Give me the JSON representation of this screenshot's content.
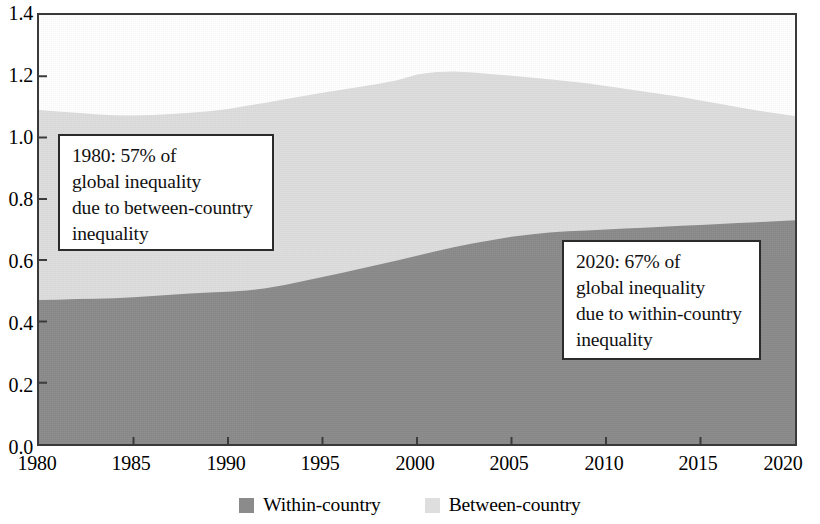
{
  "chart_data": {
    "type": "area",
    "stacked": true,
    "title": "",
    "xlabel": "",
    "ylabel": "",
    "xlim": [
      1980,
      2020
    ],
    "ylim": [
      0.0,
      1.4
    ],
    "grid": false,
    "legend_position": "bottom-center",
    "x_ticks": [
      "1980",
      "1985",
      "1990",
      "1995",
      "2000",
      "2005",
      "2010",
      "2015",
      "2020"
    ],
    "y_ticks": [
      "0.0",
      "0.2",
      "0.4",
      "0.6",
      "0.8",
      "1.0",
      "1.2",
      "1.4"
    ],
    "x": [
      1980,
      1981,
      1982,
      1983,
      1984,
      1985,
      1986,
      1987,
      1988,
      1989,
      1990,
      1991,
      1992,
      1993,
      1994,
      1995,
      1996,
      1997,
      1998,
      1999,
      2000,
      2001,
      2002,
      2003,
      2004,
      2005,
      2006,
      2007,
      2008,
      2009,
      2010,
      2011,
      2012,
      2013,
      2014,
      2015,
      2016,
      2017,
      2018,
      2019,
      2020
    ],
    "series": [
      {
        "name": "Within-country",
        "color": "#8b8b8b",
        "values": [
          0.47,
          0.471,
          0.473,
          0.474,
          0.476,
          0.479,
          0.483,
          0.487,
          0.491,
          0.494,
          0.497,
          0.501,
          0.508,
          0.519,
          0.532,
          0.545,
          0.558,
          0.572,
          0.586,
          0.6,
          0.614,
          0.629,
          0.643,
          0.655,
          0.666,
          0.676,
          0.684,
          0.69,
          0.694,
          0.697,
          0.7,
          0.703,
          0.706,
          0.709,
          0.712,
          0.715,
          0.718,
          0.721,
          0.724,
          0.727,
          0.73
        ]
      },
      {
        "name": "Between-country",
        "color": "#dedede",
        "values": [
          0.62,
          0.614,
          0.608,
          0.602,
          0.597,
          0.593,
          0.591,
          0.59,
          0.59,
          0.592,
          0.596,
          0.603,
          0.606,
          0.606,
          0.604,
          0.601,
          0.598,
          0.594,
          0.59,
          0.588,
          0.592,
          0.585,
          0.573,
          0.557,
          0.541,
          0.526,
          0.512,
          0.5,
          0.49,
          0.48,
          0.468,
          0.456,
          0.444,
          0.432,
          0.42,
          0.406,
          0.392,
          0.378,
          0.364,
          0.352,
          0.34
        ]
      }
    ],
    "totals": [
      1.09,
      1.085,
      1.081,
      1.076,
      1.073,
      1.072,
      1.074,
      1.077,
      1.081,
      1.086,
      1.093,
      1.104,
      1.114,
      1.125,
      1.136,
      1.146,
      1.156,
      1.166,
      1.176,
      1.188,
      1.206,
      1.214,
      1.216,
      1.212,
      1.207,
      1.202,
      1.196,
      1.19,
      1.184,
      1.177,
      1.168,
      1.159,
      1.15,
      1.141,
      1.132,
      1.121,
      1.11,
      1.099,
      1.088,
      1.079,
      1.07
    ],
    "annotations": [
      {
        "id": "note-1980",
        "text": "1980: 57% of\nglobal inequality\ndue to between-country\ninequality"
      },
      {
        "id": "note-2020",
        "text": "2020: 67% of\nglobal inequality\ndue to within-country\ninequality"
      }
    ]
  },
  "legend": {
    "items": [
      {
        "label": "Within-country",
        "color": "#8b8b8b"
      },
      {
        "label": "Between-country",
        "color": "#dedede"
      }
    ]
  },
  "axis": {
    "y_labels": [
      "1.4",
      "1.2",
      "1.0",
      "0.8",
      "0.6",
      "0.4",
      "0.2",
      "0.0"
    ],
    "x_labels": [
      "1980",
      "1985",
      "1990",
      "1995",
      "2000",
      "2005",
      "2010",
      "2015",
      "2020"
    ]
  }
}
